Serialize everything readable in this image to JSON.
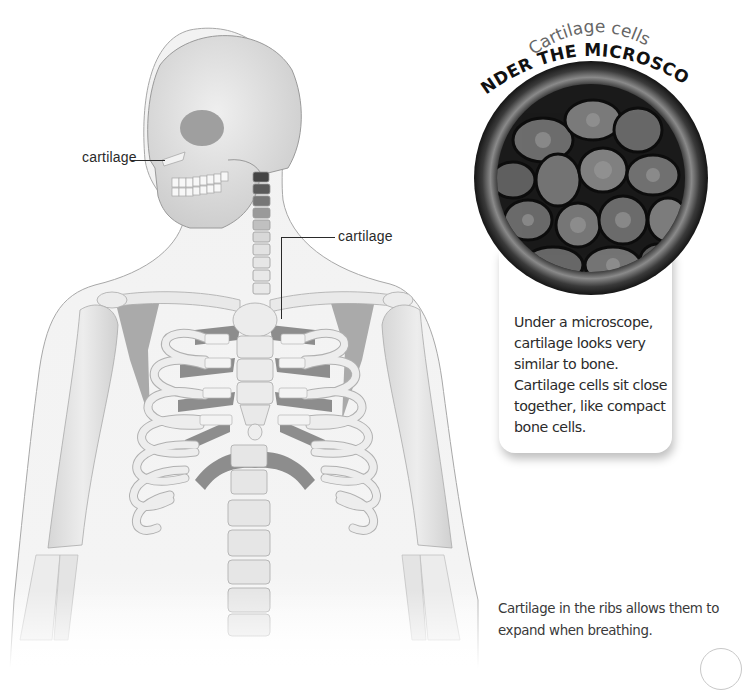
{
  "illustration": {
    "subject": "human-skeleton-upper-body",
    "labels": [
      {
        "id": "nose-cartilage",
        "text": "cartilage"
      },
      {
        "id": "sternum-cartilage",
        "text": "cartilage"
      }
    ]
  },
  "microscope": {
    "subtitle": "Cartilage cells",
    "title": "UNDER THE MICROSCOPE",
    "description": "Under a microscope, cartilage looks very similar to bone. Cartilage cells sit close together, like compact bone cells."
  },
  "caption": {
    "text": "Cartilage in the ribs allows them to expand when breathing."
  },
  "colors": {
    "bone": "#e8e8e8",
    "bone_outline": "#b5b5b5",
    "body_outline": "#9a9a9a",
    "shadow": "#5a5a5a",
    "text": "#2b2b2b"
  }
}
